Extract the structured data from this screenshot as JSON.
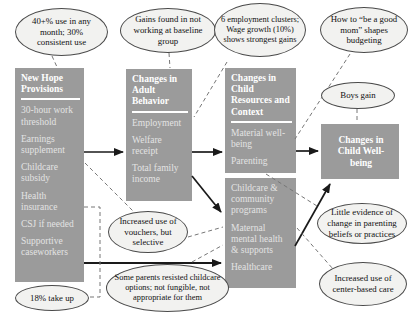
{
  "boxes": {
    "provisions": {
      "title": "New Hope Provisions",
      "items": [
        "30-hour work threshold",
        "Earnings supplement",
        "Childcare subsidy",
        "Health insurance",
        "CSJ if needed",
        "Supportive caseworkers"
      ]
    },
    "adult": {
      "title": "Changes in Adult Behavior",
      "items": [
        "Employment",
        "Welfare receipt",
        "Total family income"
      ]
    },
    "child_resources": {
      "title": "Changes in Child Resources and Context",
      "items": [
        "Material well-being",
        "Parenting"
      ]
    },
    "community": {
      "items": [
        "Childcare & community programs",
        "Maternal mental health & supports",
        "Healthcare"
      ]
    },
    "wellbeing": {
      "title": "Changes in Child Well-being"
    }
  },
  "callouts": {
    "usage": "40+% use in any month; 30% consistent use",
    "baseline": "Gains found in not working at baseline group",
    "employment_clusters": "6 employment clusters; Wage growth (10%) shows strongest gains",
    "good_mom": "How to “be a good mom” shapes budgeting",
    "boys_gain": "Boys gain",
    "vouchers": "Increased use of vouchers, but selective",
    "resisted": "Some parents resisted childcare options; not fungible, not appropriate for them",
    "take_up": "18% take up",
    "parenting_evidence": "Little evidence of change in parenting beliefs or practices",
    "center_based": "Increased use of center-based care"
  },
  "colors": {
    "box_fill": "#9b9b9b",
    "box_title_text": "#ffffff",
    "box_item_text": "#e3e3e3",
    "callout_fill": "#f2f2f0",
    "callout_stroke": "#4a4a4a",
    "arrow": "#1a1a1a",
    "dashed_line": "#777777",
    "background": "#ffffff"
  }
}
